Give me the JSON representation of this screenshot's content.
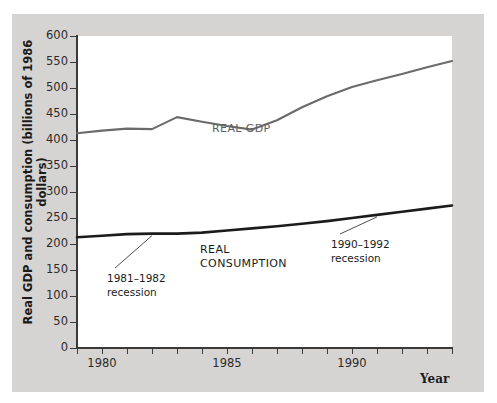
{
  "chart_data": {
    "type": "line",
    "title": "",
    "xlabel": "Year",
    "ylabel": "Real GDP and consumption (billions of 1986 dollars)",
    "xlim": [
      1979,
      1994
    ],
    "ylim": [
      0,
      600
    ],
    "ytick_values": [
      0,
      50,
      100,
      150,
      200,
      250,
      300,
      350,
      400,
      450,
      500,
      550,
      600
    ],
    "ytick_labels": [
      "0",
      "50",
      "100",
      "150",
      "200",
      "250",
      "300",
      "350",
      "400",
      "450",
      "500",
      "550",
      "600"
    ],
    "xtick_values": [
      1979,
      1980,
      1981,
      1982,
      1983,
      1984,
      1985,
      1986,
      1987,
      1988,
      1989,
      1990,
      1991,
      1992,
      1993,
      1994
    ],
    "xtick_labels": [
      "",
      "1980",
      "",
      "",
      "",
      "",
      "1985",
      "",
      "",
      "",
      "",
      "1990",
      "",
      "",
      "",
      ""
    ],
    "grid": false,
    "legend_position": "inline-labels",
    "x": [
      1979,
      1980,
      1981,
      1982,
      1983,
      1984,
      1985,
      1986,
      1987,
      1988,
      1989,
      1990,
      1991,
      1992,
      1993,
      1994
    ],
    "series": [
      {
        "name": "REAL GDP",
        "color": "#6b6b6b",
        "values": [
          413,
          418,
          422,
          421,
          444,
          435,
          427,
          420,
          438,
          463,
          484,
          502,
          515,
          527,
          540,
          552
        ]
      },
      {
        "name": "REAL CONSUMPTION",
        "color": "#1b1b1b",
        "values": [
          213,
          216,
          219,
          220,
          220,
          222,
          226,
          230,
          234,
          239,
          244,
          250,
          256,
          262,
          268,
          274
        ]
      }
    ],
    "annotations": [
      {
        "text_line1": "1981–1982",
        "text_line2": "recession"
      },
      {
        "text_line1": "1990–1992",
        "text_line2": "recession"
      }
    ]
  },
  "labels": {
    "series_gdp_line1": "REAL GDP",
    "series_cons_line1": "REAL",
    "series_cons_line2": "CONSUMPTION",
    "anno1_line1": "1981–1982",
    "anno1_line2": "recession",
    "anno2_line1": "1990–1992",
    "anno2_line2": "recession"
  },
  "axis": {
    "y_title": "Real GDP and consumption (billions of 1986 dollars)",
    "x_title": "Year",
    "y_labels": [
      "600",
      "550",
      "500",
      "450",
      "400",
      "350",
      "300",
      "250",
      "200",
      "150",
      "100",
      "50",
      "0"
    ],
    "x_labels": [
      "1980",
      "1985",
      "1990"
    ]
  },
  "colors": {
    "plate": "#d6d4d2",
    "plot_bg": "#ffffff",
    "axis": "#3a3a3a",
    "gdp_line": "#6b6b6b",
    "consumption_line": "#1b1b1b"
  }
}
